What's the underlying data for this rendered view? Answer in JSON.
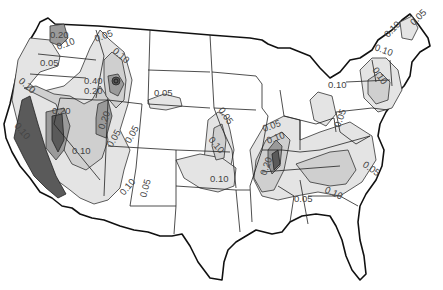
{
  "map": {
    "title": "",
    "colors": {
      "background": "#ffffff",
      "zone_005": "#e4e4e4",
      "zone_010": "#cfcfcf",
      "zone_020": "#9a9a9a",
      "zone_040": "#5a5a5a",
      "boundary": "#222222"
    },
    "contour_labels": [
      {
        "id": "wa-020",
        "text": "0.20"
      },
      {
        "id": "wa-010",
        "text": "0.10"
      },
      {
        "id": "or-005",
        "text": "0.05"
      },
      {
        "id": "mt-005",
        "text": "0.05"
      },
      {
        "id": "mt-010",
        "text": "0.10"
      },
      {
        "id": "id-040",
        "text": "0.40"
      },
      {
        "id": "id-020",
        "text": "0.20"
      },
      {
        "id": "ca-010-top",
        "text": "0.10"
      },
      {
        "id": "ca-020",
        "text": "0.20"
      },
      {
        "id": "ca-010-coast",
        "text": "0.10"
      },
      {
        "id": "ut-020",
        "text": "0.20"
      },
      {
        "id": "ut-005",
        "text": "0.05"
      },
      {
        "id": "co-005",
        "text": "0.05"
      },
      {
        "id": "nv-010",
        "text": "0.10"
      },
      {
        "id": "az-010",
        "text": "0.10"
      },
      {
        "id": "nm-005",
        "text": "0.05"
      },
      {
        "id": "ne-005",
        "text": "0.05"
      },
      {
        "id": "ks-005",
        "text": "0.05"
      },
      {
        "id": "ks-010",
        "text": "0.10"
      },
      {
        "id": "ok-010",
        "text": "0.10"
      },
      {
        "id": "il-005",
        "text": "0.05"
      },
      {
        "id": "il-010",
        "text": "0.10"
      },
      {
        "id": "mo-020",
        "text": "0.20"
      },
      {
        "id": "tn-005",
        "text": "0.05"
      },
      {
        "id": "sc-010",
        "text": "0.10"
      },
      {
        "id": "nc-005",
        "text": "0.05"
      },
      {
        "id": "oh-005",
        "text": "0.05"
      },
      {
        "id": "mi-010",
        "text": "0.10"
      },
      {
        "id": "ny-010",
        "text": "0.10"
      },
      {
        "id": "ne-010a",
        "text": "0.10"
      },
      {
        "id": "me-010",
        "text": "0.10"
      },
      {
        "id": "me-005",
        "text": "0.05"
      }
    ]
  }
}
